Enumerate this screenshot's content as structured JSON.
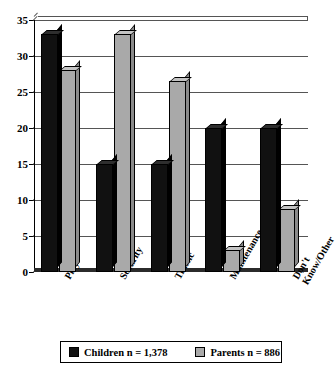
{
  "chart_data": {
    "type": "bar",
    "title": "",
    "subtitle": "",
    "xlabel": "",
    "ylabel": "",
    "categories": [
      "Play",
      "Security",
      "Traffic",
      "Maintenance",
      "Don't\nKnow/Other"
    ],
    "category_labels": [
      {
        "line1": "Play",
        "line2": ""
      },
      {
        "line1": "Security",
        "line2": ""
      },
      {
        "line1": "Traffic",
        "line2": ""
      },
      {
        "line1": "Maintenance",
        "line2": ""
      },
      {
        "line1": "Don't",
        "line2": "Know/Other"
      }
    ],
    "series": [
      {
        "name": "Children n = 1,378",
        "short_name": "Children",
        "color": "#111111",
        "values": [
          33,
          15,
          15,
          20,
          20
        ]
      },
      {
        "name": "Parents n = 886",
        "short_name": "Parents",
        "color": "#a9a9a9",
        "values": [
          28,
          33,
          26.5,
          3,
          8.7
        ]
      }
    ],
    "ylim": [
      0,
      35
    ],
    "yticks": [
      0,
      5,
      10,
      15,
      20,
      25,
      30,
      35
    ],
    "ytick_labels": [
      "0",
      "5",
      "10",
      "15",
      "20",
      "25",
      "30",
      "35"
    ],
    "grid": true,
    "grid_axis": "y",
    "legend_position": "bottom",
    "style": "3d-column"
  },
  "legend": {
    "entries": [
      {
        "label": "Children n = 1,378",
        "color": "#111111"
      },
      {
        "label": "Parents n = 886",
        "color": "#a9a9a9"
      }
    ]
  },
  "colors": {
    "children": "#111111",
    "parents": "#a9a9a9",
    "axis": "#000000",
    "grid": "#555555",
    "background": "#ffffff"
  }
}
